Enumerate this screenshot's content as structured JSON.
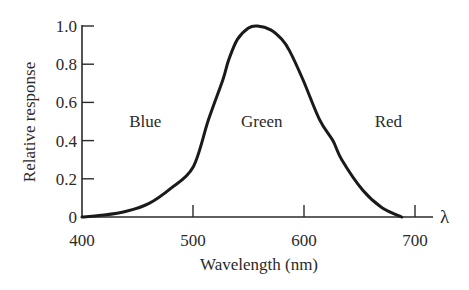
{
  "chart_data": {
    "type": "line",
    "title": "",
    "xlabel": "Wavelength (nm)",
    "ylabel": "Relative response",
    "axis_end_symbol": "λ",
    "xlim": [
      400,
      715
    ],
    "ylim": [
      0,
      1.0
    ],
    "x_ticks": [
      400,
      500,
      600,
      700
    ],
    "x_tick_labels": [
      "400",
      "500",
      "600",
      "700"
    ],
    "y_ticks": [
      0,
      0.2,
      0.4,
      0.6,
      0.8,
      1.0
    ],
    "y_tick_labels": [
      "0",
      "0.2",
      "0.4",
      "0.6",
      "0.8",
      "1.0"
    ],
    "grid": false,
    "legend": null,
    "annotations": [
      {
        "text": "Blue",
        "x": 457
      },
      {
        "text": "Green",
        "x": 562
      },
      {
        "text": "Red",
        "x": 676
      }
    ],
    "series": [
      {
        "name": "Relative response",
        "color": "#1a1a1a",
        "x": [
          400,
          420,
          440,
          460,
          480,
          500,
          514,
          527,
          532,
          540,
          550,
          558,
          570,
          580,
          587,
          599,
          614,
          626,
          634,
          653,
          670,
          688
        ],
        "y": [
          0,
          0.01,
          0.03,
          0.07,
          0.15,
          0.26,
          0.51,
          0.72,
          0.82,
          0.93,
          0.99,
          1.0,
          0.98,
          0.93,
          0.87,
          0.72,
          0.51,
          0.4,
          0.3,
          0.14,
          0.05,
          0
        ]
      }
    ]
  }
}
